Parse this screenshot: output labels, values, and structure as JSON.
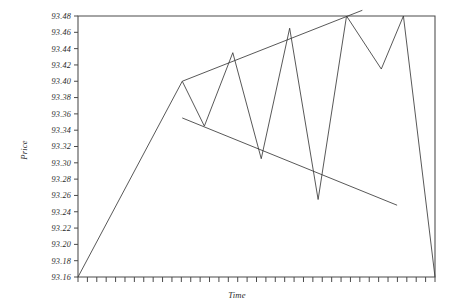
{
  "chart_data": {
    "type": "line",
    "title": "",
    "subtitle": "",
    "xlabel": "Time",
    "ylabel": "Price",
    "grid": false,
    "legend": false,
    "legend_position": "none",
    "ylim": [
      93.16,
      93.48
    ],
    "ytick_step": 0.02,
    "ytick_labels": [
      "93.48",
      "93.46",
      "93.44",
      "93.42",
      "93.40",
      "93.38",
      "93.36",
      "93.34",
      "93.32",
      "93.30",
      "93.28",
      "93.26",
      "93.24",
      "93.22",
      "93.20",
      "93.18",
      "93.16"
    ],
    "ytick_values": [
      93.48,
      93.46,
      93.44,
      93.42,
      93.4,
      93.38,
      93.36,
      93.34,
      93.32,
      93.3,
      93.28,
      93.26,
      93.24,
      93.22,
      93.2,
      93.18,
      93.16
    ],
    "xtick_labels": [],
    "xtick_count": 39,
    "x_axis_note": "unlabeled evenly spaced tick marks",
    "series": [
      {
        "name": "Price",
        "x": [
          0,
          33,
          40,
          49,
          58,
          67,
          76,
          85,
          96,
          103,
          113
        ],
        "y": [
          93.16,
          93.4,
          93.345,
          93.435,
          93.305,
          93.465,
          93.255,
          93.48,
          93.415,
          93.48,
          93.16
        ],
        "points_note": "broadening wedge: rising leg, three expanding peaks with lower troughs, final decline"
      }
    ],
    "annotations": [
      {
        "name": "upper-trendline",
        "type": "trendline",
        "direction": "ascending",
        "x": [
          33,
          90
        ],
        "y": [
          93.4,
          93.487
        ],
        "touches": [
          "peak-1",
          "peak-2",
          "peak-3"
        ]
      },
      {
        "name": "lower-trendline",
        "type": "trendline",
        "direction": "descending",
        "x": [
          33,
          101
        ],
        "y": [
          93.355,
          93.248
        ],
        "touches": [
          "trough-1",
          "trough-2",
          "trough-3"
        ]
      }
    ],
    "colors": {
      "series": "#3a3a3a",
      "trendline": "#3a3a3a",
      "axis": "#4a4a4a",
      "background": "#ffffff",
      "text": "#2a2a2a"
    }
  }
}
